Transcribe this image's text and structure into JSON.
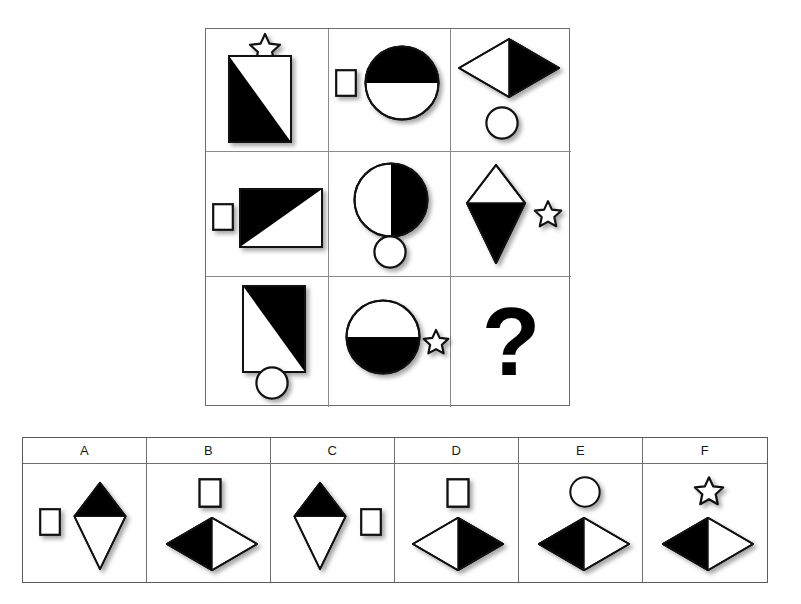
{
  "puzzle": {
    "type": "visual-analogy-matrix",
    "matrix": {
      "rows": 3,
      "cols": 3,
      "cells": [
        {
          "id": "r1c1",
          "description": "Vertical rectangle split by diagonal, lower-left black; outlined star above",
          "elements": [
            "rectangle-vertical-diagonal-lower-left-black",
            "star-outline-above"
          ]
        },
        {
          "id": "r1c2",
          "description": "Small white rectangle at left; large circle with top half black",
          "elements": [
            "small-rectangle-white-left",
            "circle-top-half-black"
          ]
        },
        {
          "id": "r1c3",
          "description": "Horizontal diamond, left half white and right half black; small white circle below",
          "elements": [
            "diamond-horizontal-right-black",
            "circle-outline-below"
          ]
        },
        {
          "id": "r2c1",
          "description": "Small white rectangle at left; horizontal rectangle with upper-left black triangle",
          "elements": [
            "small-rectangle-white-left",
            "rectangle-horizontal-diagonal-upper-left-black"
          ]
        },
        {
          "id": "r2c2",
          "description": "Circle with right half black; small white circle below",
          "elements": [
            "circle-right-half-black",
            "circle-outline-below"
          ]
        },
        {
          "id": "r2c3",
          "description": "Vertical diamond, top white and bottom black; outlined star to the right",
          "elements": [
            "diamond-vertical-bottom-black",
            "star-outline-right"
          ]
        },
        {
          "id": "r3c1",
          "description": "Vertical rectangle split by diagonal, upper-right black; small white circle below",
          "elements": [
            "rectangle-vertical-diagonal-upper-right-black",
            "circle-outline-below"
          ]
        },
        {
          "id": "r3c2",
          "description": "Circle with bottom half black; outlined star to the right",
          "elements": [
            "circle-bottom-half-black",
            "star-outline-right"
          ]
        },
        {
          "id": "r3c3",
          "description": "Missing element",
          "elements": [
            "question-mark"
          ],
          "missing": true,
          "symbol": "?"
        }
      ]
    },
    "answer_options": {
      "count": 6,
      "labels": [
        "A",
        "B",
        "C",
        "D",
        "E",
        "F"
      ],
      "items": [
        {
          "label": "A",
          "description": "Small white rectangle at left; vertical diamond with top black and bottom white",
          "elements": [
            "small-rectangle-white-left",
            "diamond-vertical-top-black"
          ]
        },
        {
          "label": "B",
          "description": "Small white rectangle above; horizontal diamond with left half black and right half white",
          "elements": [
            "small-rectangle-white-above",
            "diamond-horizontal-left-black"
          ]
        },
        {
          "label": "C",
          "description": "Vertical diamond with top black and bottom white; small white rectangle at right",
          "elements": [
            "diamond-vertical-top-black",
            "small-rectangle-white-right"
          ]
        },
        {
          "label": "D",
          "description": "Small white rectangle above; horizontal diamond with left half white and right half black",
          "elements": [
            "small-rectangle-white-above",
            "diamond-horizontal-right-black"
          ]
        },
        {
          "label": "E",
          "description": "White circle above; horizontal diamond with left half black and right half white",
          "elements": [
            "circle-outline-above",
            "diamond-horizontal-left-black"
          ]
        },
        {
          "label": "F",
          "description": "Outlined star above; horizontal diamond with left half black and right half white",
          "elements": [
            "star-outline-above",
            "diamond-horizontal-left-black"
          ]
        }
      ]
    },
    "colors": {
      "fill_black": "#000000",
      "fill_white": "#ffffff",
      "stroke": "#1a1a1a",
      "grid_line": "#8a8a8a",
      "panel_border": "#5a5a5a",
      "background": "#ffffff"
    }
  }
}
